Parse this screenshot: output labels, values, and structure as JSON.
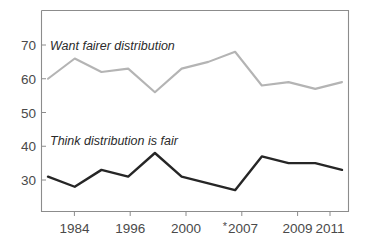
{
  "chart_data": {
    "type": "line",
    "title": "",
    "subtitle": "",
    "xlabel": "",
    "ylabel": "",
    "ylim": [
      24,
      76
    ],
    "yticks": [
      30,
      40,
      50,
      60,
      70
    ],
    "ytick_labels": [
      "30",
      "40",
      "50",
      "60",
      "70"
    ],
    "grid": false,
    "legend_position": "inline-annotation",
    "x": [
      1,
      2,
      3,
      4,
      5,
      6,
      7,
      8,
      9,
      10,
      11,
      12
    ],
    "xtick_labels": [
      "1984",
      "1996",
      "2000",
      "2007",
      "2009",
      "2011"
    ],
    "xtick_positions": [
      2,
      4,
      6,
      8,
      10,
      12
    ],
    "xtick_annotations": {
      "2007": "*"
    },
    "series": [
      {
        "name": "Want fairer distribution",
        "color": "#b4b4b4",
        "values": [
          60,
          66,
          62,
          63,
          56,
          63,
          65,
          68,
          58,
          59,
          57,
          59
        ],
        "label_text": "Want fairer distribution",
        "label_x": 2,
        "label_y": 70
      },
      {
        "name": "Think distribution is fair",
        "color": "#262626",
        "values": [
          31,
          28,
          33,
          31,
          38,
          31,
          29,
          27,
          37,
          35,
          35,
          33
        ],
        "label_text": "Think distribution is fair",
        "label_x": 2,
        "label_y": 41.5
      }
    ]
  },
  "axis": {
    "ytick_labels": [
      "70",
      "60",
      "50",
      "40",
      "30"
    ],
    "xtick_labels": [
      "1984",
      "1996",
      "2000",
      "2007",
      "2009",
      "2011"
    ],
    "asterisk": "*"
  },
  "annotations": {
    "upper_label": "Want fairer distribution",
    "lower_label": "Think distribution is fair"
  },
  "colors": {
    "upper_series": "#b4b4b4",
    "lower_series": "#262626",
    "frame": "#8c8c8c",
    "text": "#4a4a4a",
    "background": "#ffffff"
  }
}
